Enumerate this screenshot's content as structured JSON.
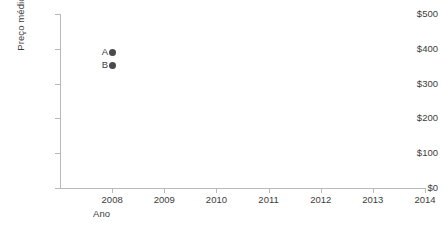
{
  "chart_data": {
    "type": "scatter",
    "title": "",
    "xlabel": "Ano",
    "ylabel": "Preço médio",
    "xlim": [
      2007.0,
      2014.0
    ],
    "ylim": [
      0,
      500
    ],
    "grid": false,
    "legend": "none",
    "x_ticks": [
      "2008",
      "2009",
      "2010",
      "2011",
      "2012",
      "2013",
      "2014"
    ],
    "x_tick_values": [
      2008,
      2009,
      2010,
      2011,
      2012,
      2013,
      2014
    ],
    "y_ticks": [
      "$0",
      "$100",
      "$200",
      "$300",
      "$400",
      "$500"
    ],
    "y_tick_values": [
      0,
      100,
      200,
      300,
      400,
      500
    ],
    "points": [
      {
        "label": "A",
        "x": 2008,
        "y": 390
      },
      {
        "label": "B",
        "x": 2008,
        "y": 353
      }
    ],
    "marker_color": "#4a4a4a",
    "axis_color": "#b9b9b9",
    "text_color": "#3c3c3c",
    "background_color": "#ffffff"
  }
}
